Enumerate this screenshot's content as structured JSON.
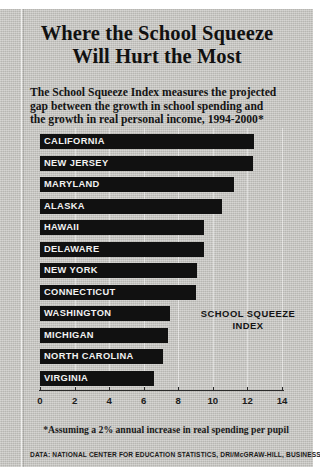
{
  "headline": {
    "line1": "Where the School Squeeze",
    "line2": "Will Hurt the Most"
  },
  "subtitle": {
    "line1": "The School Squeeze Index measures the projected",
    "line2": "gap between the growth in school spending and",
    "line3": "the growth in real personal income, 1994-2000*"
  },
  "annotation": {
    "line1": "SCHOOL SQUEEZE",
    "line2": "INDEX"
  },
  "footnote": "*Assuming a 2% annual increase in real spending per pupil",
  "source": "DATA: NATIONAL CENTER FOR EDUCATION STATISTICS, DRI/McGRAW-HILL, BUSINESS WEEK",
  "colors": {
    "bar": "#111111",
    "panel": "#c9c8c4",
    "label_text": "#f2f2f2"
  },
  "chart_data": {
    "type": "bar",
    "orientation": "horizontal",
    "title": "Where the School Squeeze Will Hurt the Most",
    "subtitle": "The School Squeeze Index measures the projected gap between the growth in school spending and the growth in real personal income, 1994-2000*",
    "xlabel": "SCHOOL SQUEEZE INDEX",
    "ylabel": "",
    "xlim": [
      0,
      14
    ],
    "xticks": [
      0,
      2,
      4,
      6,
      8,
      10,
      12,
      14
    ],
    "xtick_labels": [
      "0",
      "2",
      "4",
      "6",
      "8",
      "10",
      "12",
      "14"
    ],
    "grid": false,
    "legend": "none",
    "categories": [
      "CALIFORNIA",
      "NEW JERSEY",
      "MARYLAND",
      "ALASKA",
      "HAWAII",
      "DELAWARE",
      "NEW YORK",
      "CONNECTICUT",
      "WASHINGTON",
      "MICHIGAN",
      "NORTH CAROLINA",
      "VIRGINIA"
    ],
    "values": [
      12.4,
      12.3,
      11.2,
      10.5,
      9.5,
      9.5,
      9.1,
      9.0,
      7.5,
      7.4,
      7.1,
      6.6
    ],
    "annotations": [
      "*Assuming a 2% annual increase in real spending per pupil"
    ]
  }
}
